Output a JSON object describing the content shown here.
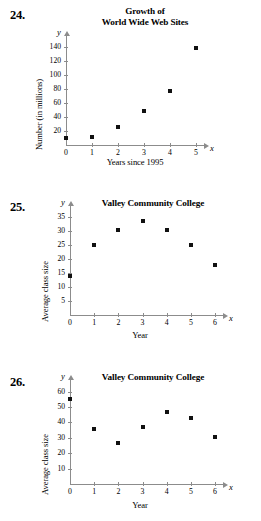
{
  "page": {
    "background": "#ffffff",
    "point_color": "#111111",
    "axis_color": "#8c8c8c"
  },
  "problems": [
    {
      "number": "24.",
      "x_axis_letter": "x",
      "y_axis_letter": "y",
      "chart_data": {
        "type": "scatter",
        "title": "Growth of\nWorld Wide Web Sites",
        "xlabel": "Years since 1995",
        "ylabel": "Number (in millions)",
        "x": [
          0,
          1,
          2,
          3,
          4,
          5
        ],
        "values": [
          10,
          12,
          26,
          49,
          77,
          139
        ],
        "xticks": [
          "0",
          "1",
          "2",
          "3",
          "4",
          "5"
        ],
        "yticks": [
          "20",
          "40",
          "60",
          "80",
          "100",
          "120",
          "140"
        ],
        "xlim": [
          0,
          5
        ],
        "ylim": [
          0,
          150
        ],
        "grid": false,
        "legend": "none"
      }
    },
    {
      "number": "25.",
      "x_axis_letter": "x",
      "y_axis_letter": "y",
      "chart_data": {
        "type": "scatter",
        "title": "Valley Community College",
        "xlabel": "Year",
        "ylabel": "Average class size",
        "x": [
          0,
          1,
          2,
          3,
          4,
          5,
          6
        ],
        "values": [
          14,
          25,
          30.5,
          33.5,
          30.5,
          25,
          18
        ],
        "xticks": [
          "0",
          "1",
          "2",
          "3",
          "4",
          "5",
          "6"
        ],
        "yticks": [
          "5",
          "10",
          "15",
          "20",
          "25",
          "30",
          "35"
        ],
        "xlim": [
          0,
          6
        ],
        "ylim": [
          0,
          37.5
        ],
        "grid": false,
        "legend": "none"
      }
    },
    {
      "number": "26.",
      "x_axis_letter": "x",
      "y_axis_letter": "y",
      "chart_data": {
        "type": "scatter",
        "title": "Valley Community College",
        "xlabel": "Year",
        "ylabel": "Average class size",
        "x": [
          0,
          1,
          2,
          3,
          4,
          5,
          6
        ],
        "values": [
          55,
          35.5,
          26.5,
          37,
          47,
          43,
          30.5
        ],
        "xticks": [
          "0",
          "1",
          "2",
          "3",
          "4",
          "5",
          "6"
        ],
        "yticks": [
          "10",
          "20",
          "30",
          "40",
          "50",
          "60"
        ],
        "xlim": [
          0,
          6
        ],
        "ylim": [
          0,
          65
        ],
        "grid": false,
        "legend": "none"
      }
    }
  ]
}
